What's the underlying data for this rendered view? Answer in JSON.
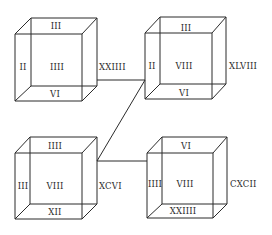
{
  "diagram": {
    "line_color": "#2b2b2b",
    "background": "#ffffff",
    "cubes": [
      {
        "id": "top-left",
        "top": "III",
        "left": "II",
        "center": "IIII",
        "bottom": "VI",
        "right": "XXIIII"
      },
      {
        "id": "top-right",
        "top": "III",
        "left": "II",
        "center": "VIII",
        "bottom": "VI",
        "right": "XLVIII"
      },
      {
        "id": "bottom-left",
        "top": "IIII",
        "left": "III",
        "center": "VIII",
        "bottom": "XII",
        "right": "XCVI"
      },
      {
        "id": "bottom-right",
        "top": "VI",
        "left": "IIII",
        "center": "VIII",
        "bottom": "XXIIII",
        "right": "CXCII"
      }
    ],
    "connectors": [
      {
        "from": "top-left",
        "to": "top-right"
      },
      {
        "from": "top-right",
        "to": "bottom-left"
      },
      {
        "from": "bottom-left",
        "to": "bottom-right"
      }
    ]
  }
}
